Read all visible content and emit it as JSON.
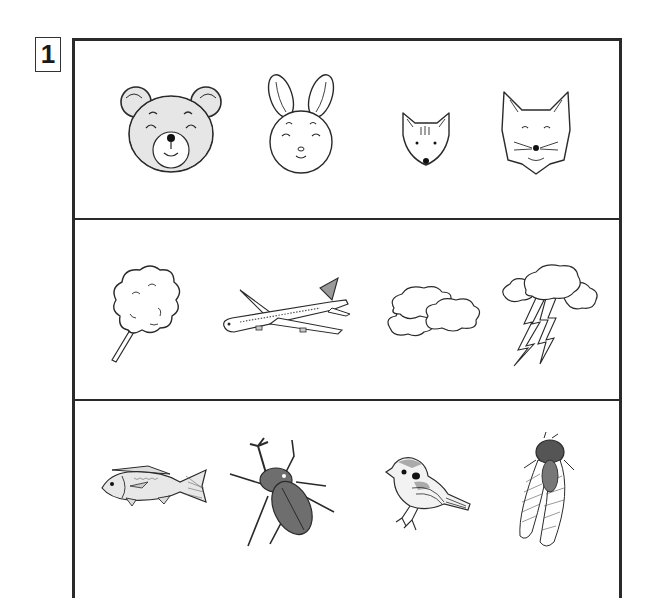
{
  "worksheet": {
    "question_number": "1",
    "rows": [
      {
        "name": "animal-faces",
        "items": [
          {
            "id": "bear",
            "label": "bear-face",
            "fill": "#e6e6e6"
          },
          {
            "id": "rabbit",
            "label": "rabbit-face",
            "fill": "#ffffff"
          },
          {
            "id": "squirrel",
            "label": "squirrel-face",
            "fill": "#ffffff"
          },
          {
            "id": "fox",
            "label": "fox-face",
            "fill": "#ffffff"
          }
        ]
      },
      {
        "name": "sky-things",
        "items": [
          {
            "id": "cotton-candy",
            "label": "cotton-candy",
            "fill": "#ffffff"
          },
          {
            "id": "airplane",
            "label": "airplane",
            "fill": "#ffffff"
          },
          {
            "id": "clouds",
            "label": "clouds",
            "fill": "#ffffff"
          },
          {
            "id": "thundercloud",
            "label": "thundercloud-lightning",
            "fill": "#ffffff"
          }
        ]
      },
      {
        "name": "creatures",
        "items": [
          {
            "id": "fish",
            "label": "fish",
            "fill": "#e8e8e8"
          },
          {
            "id": "beetle",
            "label": "rhinoceros-beetle",
            "fill": "#6e6e6e"
          },
          {
            "id": "sparrow",
            "label": "sparrow",
            "fill": "#f2f2f2"
          },
          {
            "id": "cicada",
            "label": "cicada",
            "fill": "#ffffff"
          }
        ]
      }
    ],
    "colors": {
      "line": "#2a2a2a",
      "gray_fill": "#e6e6e6",
      "dark_fill": "#6e6e6e",
      "background": "#ffffff"
    }
  }
}
